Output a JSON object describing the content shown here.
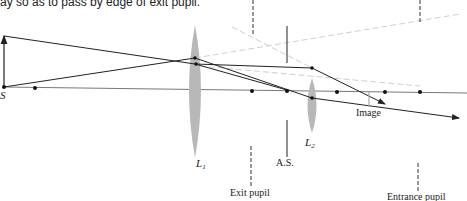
{
  "caption": "ay so as to pass by edge of exit pupil.",
  "labels": {
    "source": "S",
    "lens1": "L",
    "lens1_sub": "1",
    "lens2": "L",
    "lens2_sub": "2",
    "aperture_stop": "A.S.",
    "image": "Image",
    "exit_pupil": "Exit pupil",
    "entrance_pupil": "Entrance pupil"
  },
  "colors": {
    "ray": "#222222",
    "axis": "#555555",
    "lens_fill": "#b8b8b8",
    "virtual_ray": "#cfcfcf"
  }
}
